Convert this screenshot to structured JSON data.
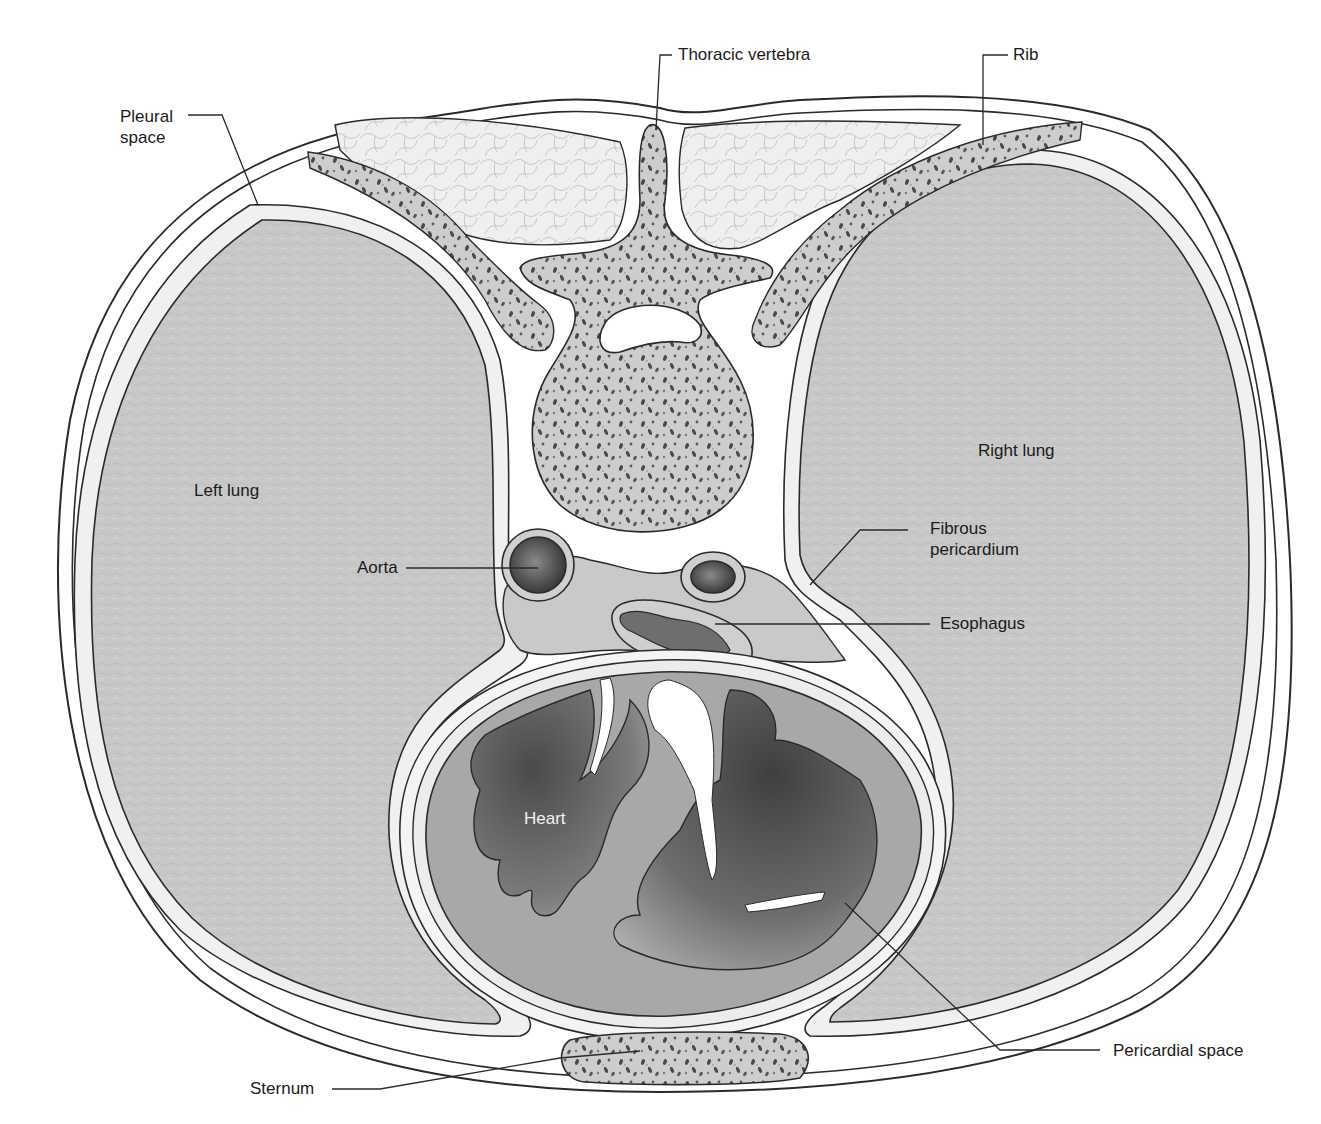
{
  "figure": {
    "type": "anatomical cross-section",
    "colors": {
      "background": "#ffffff",
      "outline": "#2a2a2a",
      "lung_fill": "#c9c9c9",
      "pleura_fill": "#ececec",
      "bone_fill": "#cfcfcf",
      "bone_pores": "#555555",
      "muscle_fill": "#eeeeee",
      "heart_wall": "#a9a9a9",
      "heart_chamber_dark": "#5a5a5a",
      "label_text": "#1a1a1a",
      "heart_label_text": "#f2f2f2"
    }
  },
  "labels": {
    "pleural_space": "Pleural\nspace",
    "pleural_space_line1": "Pleural",
    "pleural_space_line2": "space",
    "thoracic_vertebra": "Thoracic vertebra",
    "rib": "Rib",
    "left_lung": "Left lung",
    "right_lung": "Right lung",
    "aorta": "Aorta",
    "fibrous_pericardium_line1": "Fibrous",
    "fibrous_pericardium_line2": "pericardium",
    "esophagus": "Esophagus",
    "heart": "Heart",
    "pericardial_space": "Pericardial space",
    "sternum": "Sternum"
  }
}
